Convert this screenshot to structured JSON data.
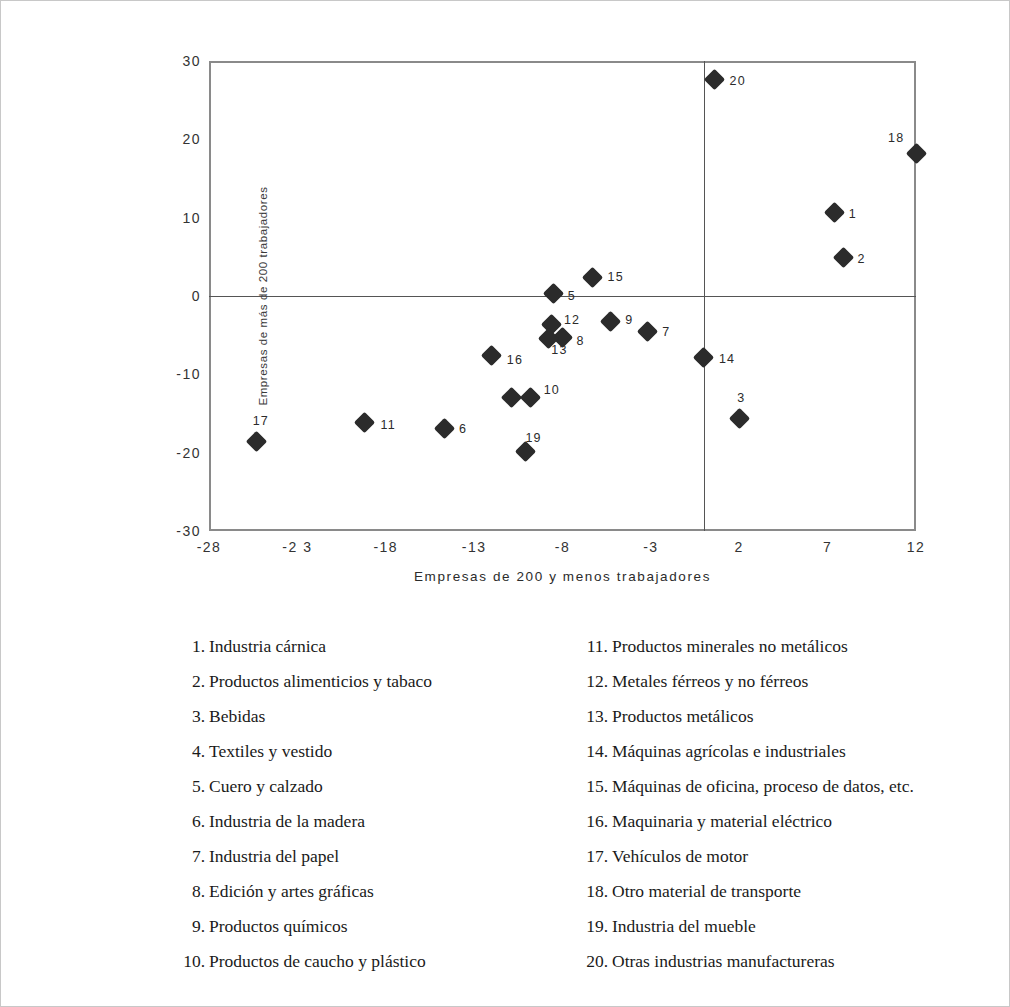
{
  "chart_data": {
    "type": "scatter",
    "title": "",
    "xlabel": "Empresas de 200 y menos trabajadores",
    "ylabel": "Empresas de más de 200 trabajadores",
    "xlim": [
      -28,
      12
    ],
    "ylim": [
      -30,
      30
    ],
    "xticks": [
      "-28",
      "-2 3",
      "-18",
      "-13",
      "-8",
      "-3",
      "2",
      "7",
      "12"
    ],
    "xtick_values": [
      -28,
      -23,
      -18,
      -13,
      -8,
      -3,
      2,
      7,
      12
    ],
    "yticks": [
      "30",
      "20",
      "10",
      "0",
      "-10",
      "-20",
      "-30"
    ],
    "ytick_values": [
      30,
      20,
      10,
      0,
      -10,
      -20,
      -30
    ],
    "grid": false,
    "legend_position": "below-plot",
    "reference_lines": {
      "horizontal": 0,
      "vertical": 0
    },
    "points": [
      {
        "label": "1",
        "x": 7.4,
        "y": 10.6,
        "label_dx": 14,
        "label_dy": -6
      },
      {
        "label": "2",
        "x": 7.9,
        "y": 4.9,
        "label_dx": 14,
        "label_dy": -6
      },
      {
        "label": "3",
        "x": 2.0,
        "y": -15.7,
        "label_dx": -2,
        "label_dy": -28
      },
      {
        "label": "4",
        "x": -10.9,
        "y": -12.9,
        "label_dx": 0,
        "label_dy": 0
      },
      {
        "label": "5",
        "x": -8.5,
        "y": 0.3,
        "label_dx": 14,
        "label_dy": -5
      },
      {
        "label": "6",
        "x": -14.7,
        "y": -16.9,
        "label_dx": 15,
        "label_dy": -6
      },
      {
        "label": "7",
        "x": -3.2,
        "y": -4.5,
        "label_dx": 15,
        "label_dy": -6
      },
      {
        "label": "8",
        "x": -8.0,
        "y": -5.3,
        "label_dx": 14,
        "label_dy": -4
      },
      {
        "label": "9",
        "x": -5.3,
        "y": -3.2,
        "label_dx": 15,
        "label_dy": -8
      },
      {
        "label": "10",
        "x": -9.8,
        "y": -12.9,
        "label_dx": 13,
        "label_dy": -14
      },
      {
        "label": "11",
        "x": -19.2,
        "y": -16.2,
        "label_dx": 16,
        "label_dy": -5
      },
      {
        "label": "12",
        "x": -8.6,
        "y": -3.7,
        "label_dx": 12,
        "label_dy": -12
      },
      {
        "label": "13",
        "x": -8.8,
        "y": -5.4,
        "label_dx": 3,
        "label_dy": 5
      },
      {
        "label": "14",
        "x": 0.0,
        "y": -7.8,
        "label_dx": 15,
        "label_dy": -5
      },
      {
        "label": "15",
        "x": -6.3,
        "y": 2.4,
        "label_dx": 15,
        "label_dy": -7
      },
      {
        "label": "16",
        "x": -12.0,
        "y": -7.6,
        "label_dx": 15,
        "label_dy": -3
      },
      {
        "label": "17",
        "x": -25.3,
        "y": -18.6,
        "label_dx": -4,
        "label_dy": -28
      },
      {
        "label": "18",
        "x": 12.0,
        "y": 18.2,
        "label_dx": -28,
        "label_dy": -22
      },
      {
        "label": "19",
        "x": -10.1,
        "y": -19.9,
        "label_dx": 0,
        "label_dy": -21
      },
      {
        "label": "20",
        "x": 0.6,
        "y": 27.7,
        "label_dx": 15,
        "label_dy": -5
      }
    ]
  },
  "legend": {
    "left_column": [
      {
        "num": "1.",
        "text": "Industria cárnica"
      },
      {
        "num": "2.",
        "text": "Productos alimenticios y tabaco"
      },
      {
        "num": "3.",
        "text": "Bebidas"
      },
      {
        "num": "4.",
        "text": "Textiles y  vestido"
      },
      {
        "num": "5.",
        "text": "Cuero y calzado"
      },
      {
        "num": "6.",
        "text": "Industria de la madera"
      },
      {
        "num": "7.",
        "text": "Industria del papel"
      },
      {
        "num": "8.",
        "text": "Edición y artes gráficas"
      },
      {
        "num": "9.",
        "text": "Productos químicos"
      },
      {
        "num": "10.",
        "text": "Productos de caucho y plástico"
      }
    ],
    "right_column": [
      {
        "num": "11.",
        "text": "Productos minerales no metálicos"
      },
      {
        "num": "12.",
        "text": "Metales férreos y no férreos"
      },
      {
        "num": "13.",
        "text": "Productos metálicos"
      },
      {
        "num": "14.",
        "text": "Máquinas agrícolas e industriales"
      },
      {
        "num": "15.",
        "text": "Máquinas de oficina, proceso de datos, etc."
      },
      {
        "num": "16.",
        "text": "Maquinaria y material eléctrico"
      },
      {
        "num": "17.",
        "text": "Vehículos de motor"
      },
      {
        "num": "18.",
        "text": "Otro material de transporte"
      },
      {
        "num": "19.",
        "text": "Industria del mueble"
      },
      {
        "num": "20.",
        "text": "Otras industrias manufactureras"
      }
    ]
  },
  "colors": {
    "marker": "#2b2b2b",
    "frame": "#8a8a8a",
    "reference_line": "#555555",
    "page_border": "#c8c8c8"
  }
}
